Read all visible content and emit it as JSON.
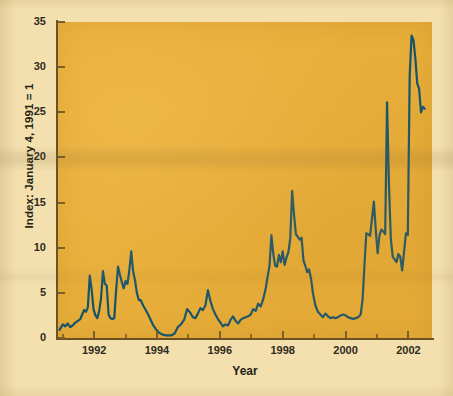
{
  "figure": {
    "background_page_color": "#f3e0ae",
    "plot_background_color": "#e8ae3a",
    "line_color": "#13536f",
    "axis_color": "#6b5220"
  },
  "ghost_text": [
    {
      "text": "4. An expansion of lenders' risk appetite for",
      "x": 150,
      "y": 30,
      "size": 11
    },
    {
      "text": "hybrid products as competition to lend",
      "x": 165,
      "y": 46,
      "size": 11
    },
    {
      "text": "increases.",
      "x": 258,
      "y": 62,
      "size": 11
    },
    {
      "text": "Subprime Mortgage Market Sizing",
      "x": 168,
      "y": 90,
      "size": 13
    },
    {
      "text": "Based on public information, we estimate",
      "x": 150,
      "y": 110,
      "size": 11
    },
    {
      "text": "subprime market 2004 originations at",
      "x": 158,
      "y": 126,
      "size": 11
    },
    {
      "text": "$530 billion, or roughly 19% of all",
      "x": 160,
      "y": 142,
      "size": 11
    },
    {
      "text": "originations. The subprime market has",
      "x": 152,
      "y": 158,
      "size": 11
    },
    {
      "text": "grown dramatically over the last decade as",
      "x": 145,
      "y": 174,
      "size": 11
    },
    {
      "text": "securitization provided the liquidity to",
      "x": 152,
      "y": 190,
      "size": 11
    },
    {
      "text": "fund loans. Subprime mortgage debt",
      "x": 150,
      "y": 206,
      "size": 11
    },
    {
      "text": "outstanding has grown at a rate of 26%",
      "x": 148,
      "y": 222,
      "size": 11
    },
    {
      "text": "per annum since 1994, with total volume",
      "x": 148,
      "y": 238,
      "size": 11
    },
    {
      "text": "Lender Exposure to Credit Risk",
      "x": 168,
      "y": 268,
      "size": 12
    },
    {
      "text": "The origination and securitization process",
      "x": 150,
      "y": 292,
      "size": 11
    }
  ],
  "chart_data": {
    "type": "line",
    "title": "",
    "xlabel": "Year",
    "ylabel": "Index: January 4, 1991 = 1",
    "xlim": [
      1990.85,
      2002.75
    ],
    "ylim": [
      0,
      35
    ],
    "yticks": [
      0,
      5,
      10,
      15,
      20,
      25,
      30,
      35
    ],
    "xticks": [
      1992,
      1994,
      1996,
      1998,
      2000,
      2002
    ],
    "xminorticks": [
      1991,
      1993,
      1995,
      1997,
      1999,
      2001
    ],
    "grid": false,
    "legend": null,
    "series": [
      {
        "name": "Subprime mortgage index",
        "color": "#13536f",
        "x": [
          1990.9,
          1991.0,
          1991.08,
          1991.16,
          1991.24,
          1991.32,
          1991.4,
          1991.48,
          1991.56,
          1991.62,
          1991.68,
          1991.74,
          1991.8,
          1991.86,
          1991.92,
          1991.98,
          1992.04,
          1992.1,
          1992.16,
          1992.22,
          1992.28,
          1992.34,
          1992.4,
          1992.46,
          1992.52,
          1992.58,
          1992.64,
          1992.7,
          1992.76,
          1992.82,
          1992.88,
          1992.94,
          1993.0,
          1993.06,
          1993.12,
          1993.18,
          1993.24,
          1993.3,
          1993.36,
          1993.42,
          1993.48,
          1993.56,
          1993.64,
          1993.72,
          1993.8,
          1993.88,
          1993.96,
          1994.06,
          1994.16,
          1994.26,
          1994.36,
          1994.46,
          1994.56,
          1994.66,
          1994.76,
          1994.86,
          1994.96,
          1995.06,
          1995.14,
          1995.22,
          1995.3,
          1995.38,
          1995.46,
          1995.54,
          1995.62,
          1995.7,
          1995.78,
          1995.86,
          1995.94,
          1996.02,
          1996.1,
          1996.18,
          1996.26,
          1996.34,
          1996.42,
          1996.5,
          1996.58,
          1996.66,
          1996.74,
          1996.82,
          1996.9,
          1996.98,
          1997.06,
          1997.14,
          1997.22,
          1997.3,
          1997.38,
          1997.46,
          1997.52,
          1997.58,
          1997.64,
          1997.7,
          1997.76,
          1997.82,
          1997.88,
          1997.94,
          1998.0,
          1998.06,
          1998.12,
          1998.18,
          1998.24,
          1998.3,
          1998.36,
          1998.42,
          1998.48,
          1998.54,
          1998.6,
          1998.66,
          1998.72,
          1998.78,
          1998.84,
          1998.9,
          1998.96,
          1999.04,
          1999.12,
          1999.2,
          1999.28,
          1999.36,
          1999.44,
          1999.52,
          1999.6,
          1999.68,
          1999.76,
          1999.84,
          1999.92,
          2000.0,
          2000.08,
          2000.16,
          2000.24,
          2000.32,
          2000.4,
          2000.48,
          2000.54,
          2000.6,
          2000.66,
          2000.72,
          2000.78,
          2000.84,
          2000.9,
          2000.96,
          2001.02,
          2001.08,
          2001.14,
          2001.2,
          2001.26,
          2001.32,
          2001.38,
          2001.44,
          2001.5,
          2001.56,
          2001.62,
          2001.68,
          2001.74,
          2001.8,
          2001.86,
          2001.92,
          2001.98,
          2002.04,
          2002.1,
          2002.16,
          2002.22,
          2002.28,
          2002.34,
          2002.4,
          2002.46,
          2002.52
        ],
        "values": [
          0.9,
          1.5,
          1.3,
          1.6,
          1.2,
          1.4,
          1.7,
          1.9,
          2.1,
          2.6,
          3.1,
          2.9,
          3.4,
          6.9,
          5.4,
          3.2,
          2.5,
          2.2,
          3.0,
          4.4,
          7.4,
          6.0,
          5.8,
          2.6,
          2.2,
          2.1,
          2.2,
          5.3,
          7.9,
          7.0,
          6.2,
          5.5,
          6.3,
          6.0,
          7.5,
          9.6,
          7.4,
          6.4,
          5.0,
          4.2,
          4.2,
          3.6,
          3.1,
          2.6,
          2.0,
          1.4,
          1.0,
          0.6,
          0.4,
          0.3,
          0.3,
          0.3,
          0.5,
          1.2,
          1.5,
          2.0,
          3.2,
          2.8,
          2.3,
          2.2,
          2.7,
          3.3,
          3.1,
          3.6,
          5.3,
          4.1,
          3.2,
          2.6,
          2.1,
          1.7,
          1.3,
          1.5,
          1.4,
          2.0,
          2.4,
          1.9,
          1.6,
          2.0,
          2.2,
          2.3,
          2.4,
          2.6,
          3.2,
          3.0,
          3.8,
          3.5,
          4.3,
          5.5,
          6.8,
          8.0,
          11.4,
          9.3,
          8.0,
          7.9,
          9.2,
          8.4,
          9.6,
          8.1,
          8.9,
          9.5,
          11.0,
          16.3,
          13.6,
          11.5,
          11.2,
          10.9,
          11.1,
          8.6,
          8.0,
          7.3,
          7.6,
          6.6,
          5.0,
          3.6,
          2.9,
          2.6,
          2.3,
          2.7,
          2.4,
          2.2,
          2.3,
          2.2,
          2.3,
          2.5,
          2.6,
          2.5,
          2.3,
          2.2,
          2.1,
          2.2,
          2.3,
          2.6,
          4.2,
          8.0,
          11.6,
          11.5,
          11.3,
          13.2,
          15.1,
          12.0,
          9.4,
          11.4,
          12.0,
          11.8,
          11.5,
          26.1,
          17.0,
          11.0,
          9.0,
          8.7,
          8.4,
          9.3,
          9.0,
          7.5,
          9.5,
          11.6,
          11.4,
          29.0,
          33.5,
          33.0,
          31.0,
          28.2,
          27.6,
          25.0,
          25.6,
          25.4
        ]
      }
    ]
  }
}
